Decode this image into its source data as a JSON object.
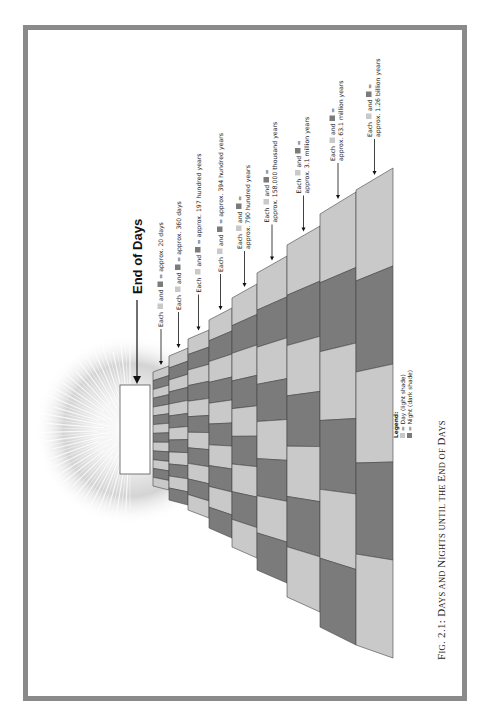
{
  "figure": {
    "title": "End of Days",
    "caption_parts": [
      {
        "text": "F",
        "big": true
      },
      {
        "text": "IG",
        "big": false
      },
      {
        "text": ". 2.1: ",
        "big": true
      },
      {
        "text": "D",
        "big": true
      },
      {
        "text": "AYS AND ",
        "big": false
      },
      {
        "text": "N",
        "big": true
      },
      {
        "text": "IGHTS UNTIL THE ",
        "big": false
      },
      {
        "text": "E",
        "big": true
      },
      {
        "text": "ND OF ",
        "big": false
      },
      {
        "text": "D",
        "big": true
      },
      {
        "text": "AYS",
        "big": false
      }
    ],
    "caption": "Fig. 2.1: Days and Nights until the End of Days"
  },
  "legend": {
    "heading": "Legend:",
    "items": [
      {
        "label": "= Day (light shade)",
        "color": "#c8c8c8"
      },
      {
        "label": "= Night (dark shade)",
        "color": "#7a7a7a"
      }
    ]
  },
  "colors": {
    "day": "#c9c9c9",
    "night": "#7b7b7b",
    "frame": "#8a8a8a",
    "outline": "#444444"
  },
  "levels": [
    {
      "each": "Each",
      "and": "and",
      "eq": "= approx. 20 days",
      "cells": 13
    },
    {
      "each": "Each",
      "and": "and",
      "eq": "= approx. 360 days",
      "cells": 12
    },
    {
      "each": "Each",
      "and": "and",
      "eq": "= approx. 197 hundred years",
      "cells": 11
    },
    {
      "each": "Each",
      "and": "and",
      "eq": "= approx. 394 hundred years",
      "cells": 10
    },
    {
      "each": "Each",
      "and": "and =",
      "eq": "approx. 790 hundred years",
      "cells": 9
    },
    {
      "each": "Each",
      "and": "and =",
      "eq": "approx. 158,000 thousand years",
      "cells": 8
    },
    {
      "each": "Each",
      "and": "and =",
      "eq": "approx. 3.1 million years",
      "cells": 7
    },
    {
      "each": "Each",
      "and": "and =",
      "eq": "approx. 63.1 million years",
      "cells": 6
    },
    {
      "each": "Each",
      "and": "and =",
      "eq": "approx. 1.26 billion years",
      "cells": 5
    }
  ]
}
